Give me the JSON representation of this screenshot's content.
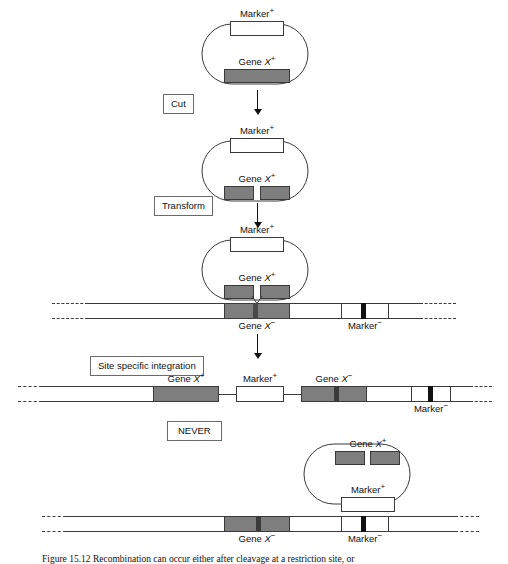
{
  "figure": {
    "title_prefix": "Figure 15.12",
    "caption": "Figure 15.12  Recombination can occur either after cleavage at a restriction site, or"
  },
  "labels": {
    "marker_plus": "Marker",
    "marker_minus": "Marker",
    "gene_plus": "Gene X",
    "gene_minus": "Gene X",
    "sup_plus": "+",
    "sup_minus": "−",
    "gene_word": "Gene",
    "gene_italic": "X",
    "marker_word": "Marker"
  },
  "steps": {
    "cut": "Cut",
    "transform": "Transform",
    "site_specific_integration": "Site specific integration",
    "never": "NEVER"
  },
  "colors": {
    "gene_fill": "#7e7e7e",
    "marker_fill": "#ffffff",
    "marker_minus_band": "#111111",
    "outline": "#3a3a3a",
    "background": "#ffffff"
  },
  "stages": [
    {
      "id": "plasmid-intact",
      "kind": "plasmid",
      "top_segment": {
        "label": "Marker",
        "sign": "+",
        "fill": "white",
        "split": false
      },
      "bottom_segment": {
        "label": "Gene X",
        "sign": "+",
        "fill": "gray",
        "split": false
      }
    },
    {
      "id": "plasmid-cut",
      "kind": "plasmid",
      "top_segment": {
        "label": "Marker",
        "sign": "+",
        "fill": "white",
        "split": false
      },
      "bottom_segment": {
        "label": "Gene X",
        "sign": "+",
        "fill": "gray",
        "split": true
      }
    },
    {
      "id": "plasmid-pairing-with-chromosome",
      "kind": "plasmid-over-chromosome",
      "top_segment": {
        "label": "Marker",
        "sign": "+",
        "fill": "white",
        "split": false
      },
      "bottom_segment": {
        "label": "Gene X",
        "sign": "+",
        "fill": "gray",
        "split": true
      },
      "crossover": true
    },
    {
      "id": "chromosome-recipient",
      "kind": "chromosome",
      "segments": [
        {
          "label": "Gene X",
          "sign": "−",
          "fill": "gray",
          "band": true
        },
        {
          "label": "Marker",
          "sign": "−",
          "fill": "white",
          "band": true
        }
      ]
    },
    {
      "id": "chromosome-integrated",
      "kind": "chromosome",
      "segments": [
        {
          "label": "Gene X",
          "sign": "+",
          "fill": "gray",
          "band": false
        },
        {
          "label": "Marker",
          "sign": "+",
          "fill": "white",
          "band": false
        },
        {
          "label": "Gene X",
          "sign": "−",
          "fill": "gray",
          "band": true
        },
        {
          "label": "Marker",
          "sign": "−",
          "fill": "white",
          "band": true
        }
      ]
    },
    {
      "id": "plasmid-never",
      "kind": "plasmid",
      "top_segment": {
        "label": "Gene X",
        "sign": "+",
        "fill": "gray",
        "split": true
      },
      "bottom_segment": {
        "label": "Marker",
        "sign": "+",
        "fill": "white",
        "split": false
      }
    },
    {
      "id": "chromosome-never",
      "kind": "chromosome",
      "segments": [
        {
          "label": "Gene X",
          "sign": "−",
          "fill": "gray",
          "band": true
        },
        {
          "label": "Marker",
          "sign": "−",
          "fill": "white",
          "band": true
        }
      ]
    }
  ]
}
